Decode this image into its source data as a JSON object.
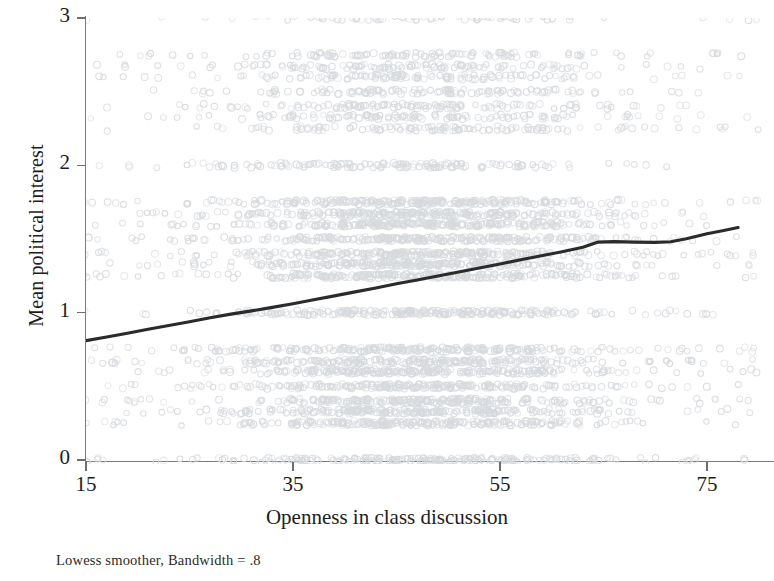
{
  "chart_data": {
    "type": "scatter",
    "title": "",
    "subtitle": "",
    "caption": "Lowess smoother, Bandwidth = .8",
    "xlabel": "Openness in class discussion",
    "ylabel": "Mean political interest",
    "xlim": [
      13.5,
      80.5
    ],
    "ylim": [
      -0.05,
      3.05
    ],
    "xticks": [
      15,
      35,
      55,
      75
    ],
    "xtick_labels": [
      "15",
      "35",
      "55",
      "75"
    ],
    "yticks": [
      0,
      1,
      2,
      3
    ],
    "ytick_labels": [
      "0",
      "1",
      "2",
      "3"
    ],
    "grid": false,
    "legend": "none",
    "point_color": "#d6d9dd",
    "line_color": "#2b2b2b",
    "axis_color": "#7c7c7c",
    "background": "#ffffff",
    "series": [
      {
        "name": "Lowess smoother",
        "type": "line",
        "bandwidth": 0.8,
        "x": [
          15,
          17,
          19,
          21,
          23,
          25,
          27,
          29,
          31,
          33,
          35,
          37,
          39,
          41,
          43,
          45,
          47,
          49,
          51,
          53,
          55,
          57,
          59,
          61,
          63,
          64.5,
          66,
          68,
          70,
          71.5,
          73,
          75,
          76.5,
          78
        ],
        "y": [
          0.81,
          0.835,
          0.861,
          0.887,
          0.913,
          0.939,
          0.965,
          0.99,
          1.012,
          1.036,
          1.061,
          1.088,
          1.114,
          1.141,
          1.168,
          1.196,
          1.222,
          1.249,
          1.276,
          1.303,
          1.331,
          1.359,
          1.387,
          1.414,
          1.444,
          1.479,
          1.482,
          1.479,
          1.477,
          1.481,
          1.502,
          1.536,
          1.556,
          1.578
        ]
      },
      {
        "name": "Observations",
        "type": "scatter",
        "note": "Discrete mean-of-ordinal values produce horizontal bands; density peaks between x=33 and x=62.",
        "y_bands": [
          0,
          0.25,
          0.33,
          0.4,
          0.5,
          0.6,
          0.67,
          0.75,
          1.0,
          1.25,
          1.33,
          1.4,
          1.5,
          1.6,
          1.67,
          1.75,
          2.0,
          2.25,
          2.33,
          2.4,
          2.5,
          2.6,
          2.67,
          2.75,
          3.0
        ],
        "x_range": [
          14,
          80
        ]
      }
    ]
  },
  "axes": {
    "y_title": "Mean political interest",
    "x_title": "Openness in class discussion"
  },
  "footer": {
    "note": "Lowess smoother, Bandwidth = .8"
  }
}
